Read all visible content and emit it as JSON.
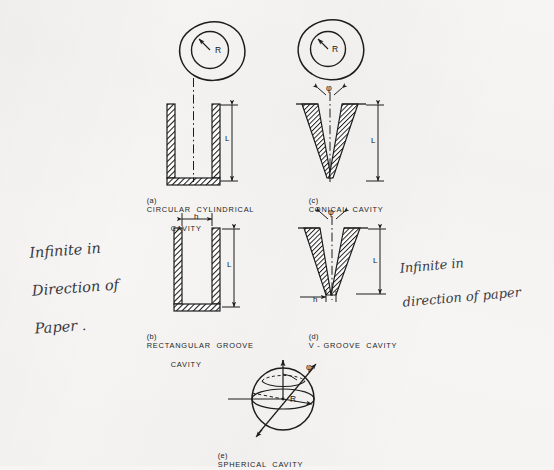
{
  "figure": {
    "background_color": "#f6f5f3",
    "ink_color": "#1d1d1d",
    "pencil_color": "#3a3a42"
  },
  "panels": [
    {
      "id": "a",
      "tag": "(a)",
      "caption_line1": "CIRCULAR  CYLINDRICAL",
      "caption_line2": "CAVITY",
      "has_top_view": true,
      "top_view_label": "R",
      "dimensions": [
        "L"
      ],
      "depth_label": "L"
    },
    {
      "id": "b",
      "tag": "(b)",
      "caption_line1": "RECTANGULAR  GROOVE",
      "caption_line2": "CAVITY",
      "has_top_view": false,
      "dimensions": [
        "h",
        "L"
      ],
      "width_label": "h",
      "depth_label": "L"
    },
    {
      "id": "c",
      "tag": "(c)",
      "caption_line1": "CONICAL  CAVITY",
      "caption_line2": "",
      "has_top_view": true,
      "top_view_label": "R",
      "dimensions": [
        "φ",
        "L"
      ],
      "angle_label": "φ",
      "depth_label": "L"
    },
    {
      "id": "d",
      "tag": "(d)",
      "caption_line1": "V - GROOVE  CAVITY",
      "caption_line2": "",
      "has_top_view": false,
      "dimensions": [
        "φ",
        "L",
        "h"
      ],
      "angle_label": "φ",
      "depth_label": "L",
      "width_label": "h"
    },
    {
      "id": "e",
      "tag": "(e)",
      "caption_line1": "SPHERICAL  CAVITY",
      "caption_line2": "",
      "has_top_view": false,
      "dimensions": [
        "φ",
        "R"
      ],
      "angle_label": "φ",
      "radius_label": "R"
    }
  ],
  "annotations": {
    "left_note_line1": "Infinite in",
    "left_note_line2": "Direction of",
    "left_note_line3": "Paper .",
    "right_note_line1": "Infinite in",
    "right_note_line2": "direction of paper"
  },
  "symbols": {
    "radius": "R",
    "depth": "L",
    "width": "h",
    "angle": "φ"
  }
}
